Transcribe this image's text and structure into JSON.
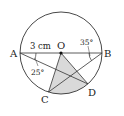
{
  "diagram": {
    "type": "circle-geometry",
    "circle": {
      "center_label": "O",
      "cx": 61,
      "cy": 53,
      "r": 41
    },
    "points": {
      "A": {
        "label": "A",
        "x": 20,
        "y": 53
      },
      "B": {
        "label": "B",
        "x": 102,
        "y": 53
      },
      "O": {
        "label": "O",
        "x": 61,
        "y": 53
      },
      "C": {
        "label": "C",
        "x": 48.5,
        "y": 92
      },
      "D": {
        "label": "D",
        "x": 88,
        "y": 84
      }
    },
    "labels": {
      "radius": "3 cm",
      "angle_A": "25°",
      "angle_B": "35°"
    },
    "colors": {
      "stroke": "#333333",
      "shade": "#d9d9d9",
      "background": "#ffffff"
    }
  }
}
